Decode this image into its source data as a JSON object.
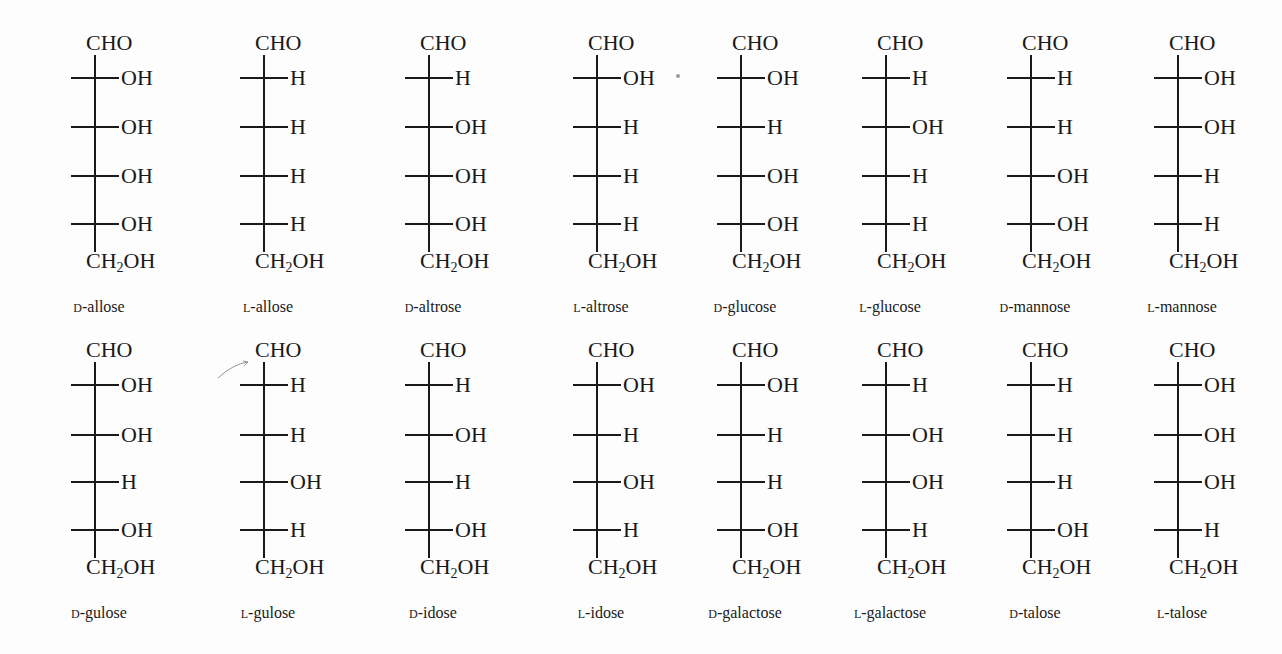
{
  "layout": {
    "columns_x": [
      95,
      264,
      429,
      597,
      741,
      886,
      1031,
      1178
    ],
    "rows": [
      {
        "cho_y": 44,
        "center_y": [
          78,
          127,
          176,
          224
        ],
        "ch2oh_y": 262,
        "label_y": 308
      },
      {
        "cho_y": 351,
        "center_y": [
          385,
          435,
          482,
          530
        ],
        "ch2oh_y": 568,
        "label_y": 614
      }
    ]
  },
  "top_group": "CHO",
  "bottom_group": {
    "main": "CH",
    "sub": "2",
    "rest": "OH"
  },
  "molecules": [
    {
      "config": "D",
      "name": "allose",
      "row": 0,
      "col": 0,
      "sub": [
        [
          "H",
          "OH"
        ],
        [
          "H",
          "OH"
        ],
        [
          "H",
          "OH"
        ],
        [
          "H",
          "OH"
        ]
      ]
    },
    {
      "config": "L",
      "name": "allose",
      "row": 0,
      "col": 1,
      "sub": [
        [
          "HO",
          "H"
        ],
        [
          "HO",
          "H"
        ],
        [
          "HO",
          "H"
        ],
        [
          "HO",
          "H"
        ]
      ]
    },
    {
      "config": "D",
      "name": "altrose",
      "row": 0,
      "col": 2,
      "sub": [
        [
          "HO",
          "H"
        ],
        [
          "H",
          "OH"
        ],
        [
          "H",
          "OH"
        ],
        [
          "H",
          "OH"
        ]
      ]
    },
    {
      "config": "L",
      "name": "altrose",
      "row": 0,
      "col": 3,
      "sub": [
        [
          "H",
          "OH"
        ],
        [
          "HO",
          "H"
        ],
        [
          "HO",
          "H"
        ],
        [
          "HO",
          "H"
        ]
      ]
    },
    {
      "config": "D",
      "name": "glucose",
      "row": 0,
      "col": 4,
      "sub": [
        [
          "H",
          "OH"
        ],
        [
          "HO",
          "H"
        ],
        [
          "H",
          "OH"
        ],
        [
          "H",
          "OH"
        ]
      ]
    },
    {
      "config": "L",
      "name": "glucose",
      "row": 0,
      "col": 5,
      "sub": [
        [
          "HO",
          "H"
        ],
        [
          "H",
          "OH"
        ],
        [
          "HO",
          "H"
        ],
        [
          "HO",
          "H"
        ]
      ]
    },
    {
      "config": "D",
      "name": "mannose",
      "row": 0,
      "col": 6,
      "sub": [
        [
          "HO",
          "H"
        ],
        [
          "HO",
          "H"
        ],
        [
          "H",
          "OH"
        ],
        [
          "H",
          "OH"
        ]
      ]
    },
    {
      "config": "L",
      "name": "mannose",
      "row": 0,
      "col": 7,
      "sub": [
        [
          "H",
          "OH"
        ],
        [
          "H",
          "OH"
        ],
        [
          "HO",
          "H"
        ],
        [
          "HO",
          "H"
        ]
      ]
    },
    {
      "config": "D",
      "name": "gulose",
      "row": 1,
      "col": 0,
      "sub": [
        [
          "H",
          "OH"
        ],
        [
          "H",
          "OH"
        ],
        [
          "HO",
          "H"
        ],
        [
          "H",
          "OH"
        ]
      ]
    },
    {
      "config": "L",
      "name": "gulose",
      "row": 1,
      "col": 1,
      "sub": [
        [
          "HO",
          "H"
        ],
        [
          "HO",
          "H"
        ],
        [
          "H",
          "OH"
        ],
        [
          "HO",
          "H"
        ]
      ]
    },
    {
      "config": "D",
      "name": "idose",
      "row": 1,
      "col": 2,
      "sub": [
        [
          "HO",
          "H"
        ],
        [
          "H",
          "OH"
        ],
        [
          "HO",
          "H"
        ],
        [
          "H",
          "OH"
        ]
      ]
    },
    {
      "config": "L",
      "name": "idose",
      "row": 1,
      "col": 3,
      "sub": [
        [
          "H",
          "OH"
        ],
        [
          "HO",
          "H"
        ],
        [
          "H",
          "OH"
        ],
        [
          "HO",
          "H"
        ]
      ]
    },
    {
      "config": "D",
      "name": "galactose",
      "row": 1,
      "col": 4,
      "sub": [
        [
          "H",
          "OH"
        ],
        [
          "HO",
          "H"
        ],
        [
          "HO",
          "H"
        ],
        [
          "H",
          "OH"
        ]
      ]
    },
    {
      "config": "L",
      "name": "galactose",
      "row": 1,
      "col": 5,
      "sub": [
        [
          "HO",
          "H"
        ],
        [
          "H",
          "OH"
        ],
        [
          "H",
          "OH"
        ],
        [
          "HO",
          "H"
        ]
      ]
    },
    {
      "config": "D",
      "name": "talose",
      "row": 1,
      "col": 6,
      "sub": [
        [
          "HO",
          "H"
        ],
        [
          "HO",
          "H"
        ],
        [
          "HO",
          "H"
        ],
        [
          "H",
          "OH"
        ]
      ]
    },
    {
      "config": "L",
      "name": "talose",
      "row": 1,
      "col": 7,
      "sub": [
        [
          "H",
          "OH"
        ],
        [
          "H",
          "OH"
        ],
        [
          "H",
          "OH"
        ],
        [
          "HO",
          "H"
        ]
      ]
    }
  ],
  "annotations": {
    "stray_dot": {
      "x": 678,
      "y": 76
    },
    "pencil_arrow": {
      "from": [
        218,
        378
      ],
      "to": [
        248,
        362
      ]
    }
  }
}
